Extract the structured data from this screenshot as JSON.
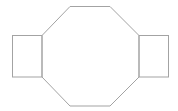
{
  "diagram": {
    "background": "#ffffff",
    "stroke_color": "#a3a3a3",
    "stroke_width": 1,
    "shapes": [
      {
        "name": "left-square",
        "type": "rect",
        "x": 12.5,
        "y": 35.5,
        "width": 29.5,
        "height": 41.5
      },
      {
        "name": "center-octagon",
        "type": "polygon",
        "points": "70,6.5 110,6.5 139,35.5 139,77 110,106 70,106 42,77 42,35.5"
      },
      {
        "name": "right-square",
        "type": "rect",
        "x": 139,
        "y": 35.5,
        "width": 29.5,
        "height": 41.5
      }
    ]
  }
}
